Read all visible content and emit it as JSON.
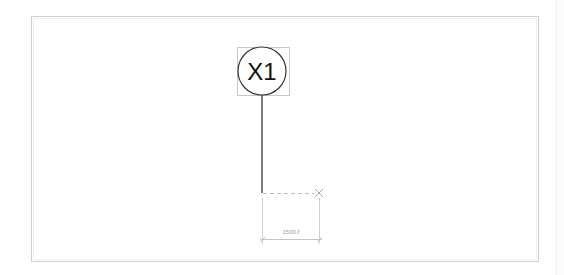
{
  "view": {
    "frame": {
      "x": 31,
      "y": 16,
      "width": 507,
      "height": 245,
      "stroke": "#cfcfcf"
    },
    "background": "#ffffff"
  },
  "grid_head": {
    "label": "X1",
    "center": {
      "x": 262,
      "y": 71
    },
    "radius": 24,
    "stroke": "#333333",
    "selection_box": {
      "x": 237,
      "y": 47,
      "width": 52,
      "height": 48,
      "stroke": "#c8c8c8"
    }
  },
  "grid_line": {
    "x": 262,
    "y1": 95,
    "y2": 193,
    "stroke": "#444444"
  },
  "temp_dimension": {
    "dashed_line": {
      "x1": 262,
      "y1": 193,
      "x2": 318,
      "y2": 193,
      "stroke": "#bdbdbd"
    },
    "end_marker": "x-cross-icon",
    "value": "1500.ℓ",
    "dim_line_y": 239,
    "x1": 262,
    "x2": 320,
    "stroke": "#bdbdbd"
  }
}
